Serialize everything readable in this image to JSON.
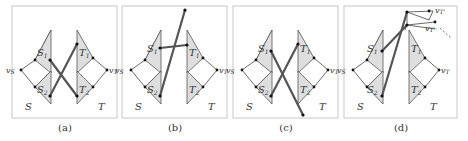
{
  "figure": {
    "panels": [
      {
        "id": "a",
        "caption": "(a)",
        "labels": {
          "S1": "S",
          "S1_sub": "1",
          "S2": "S",
          "S2_sub": "2",
          "T1": "T",
          "T1_sub": "1",
          "T2": "T",
          "T2_sub": "2",
          "vS": "v",
          "vS_sub": "S",
          "vT": "v",
          "vT_sub": "T",
          "S": "S",
          "T": "T"
        }
      },
      {
        "id": "b",
        "caption": "(b)",
        "labels": {
          "S1": "S",
          "S1_sub": "1",
          "S2": "S",
          "S2_sub": "2",
          "T1": "T",
          "T1_sub": "1",
          "T2": "T",
          "T2_sub": "2",
          "vS": "v",
          "vS_sub": "S",
          "vT": "v",
          "vT_sub": "T",
          "S": "S",
          "T": "T"
        }
      },
      {
        "id": "c",
        "caption": "(c)",
        "labels": {
          "S1": "S",
          "S1_sub": "1",
          "S2": "S",
          "S2_sub": "2",
          "T1": "T",
          "T1_sub": "1",
          "T2": "T",
          "T2_sub": "2",
          "vS": "v",
          "vS_sub": "S",
          "vT": "v",
          "vT_sub": "T",
          "S": "S",
          "T": "T"
        }
      },
      {
        "id": "d",
        "caption": "(d)",
        "labels": {
          "S1": "S",
          "S1_sub": "1",
          "S2": "S",
          "S2_sub": "2",
          "T1": "T",
          "T1_sub": "1",
          "T2": "T",
          "T2_sub": "2",
          "vS": "v",
          "vS_sub": "S",
          "vT": "v",
          "vT_sub": "T",
          "S": "S",
          "T": "T",
          "vTp": "v",
          "vTp_sub": "T'",
          "vTpp": "v",
          "vTpp_sub": "T''"
        }
      }
    ]
  }
}
